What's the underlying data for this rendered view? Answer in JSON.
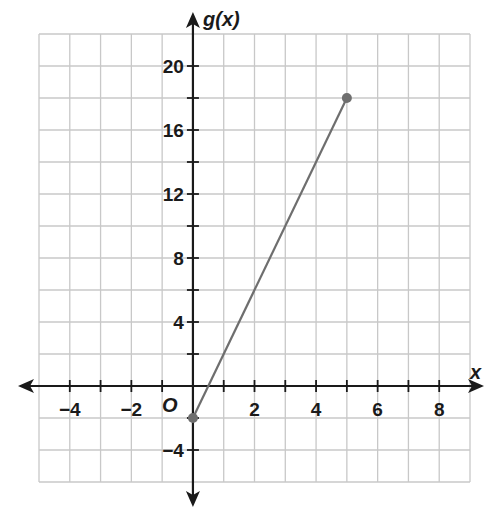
{
  "chart_data": {
    "type": "line",
    "title": "",
    "xlabel": "x",
    "ylabel": "g(x)",
    "origin_label": "O",
    "xlim": [
      -5,
      9
    ],
    "ylim": [
      -6,
      22
    ],
    "x_grid_step": 1,
    "y_grid_step": 2,
    "grid": true,
    "x_ticks": [
      -4,
      -2,
      2,
      4,
      6,
      8
    ],
    "x_tick_labels": [
      "−4",
      "−2",
      "2",
      "4",
      "6",
      "8"
    ],
    "y_ticks": [
      -4,
      4,
      8,
      12,
      16,
      20
    ],
    "y_tick_labels": [
      "−4",
      "4",
      "8",
      "12",
      "16",
      "20"
    ],
    "series": [
      {
        "name": "g(x)",
        "equation": "g(x) = 4x - 2",
        "x": [
          0,
          5
        ],
        "y": [
          -2,
          18
        ],
        "endpoints": "closed",
        "color": "#6e6e6e"
      }
    ],
    "colors": {
      "grid": "#c8c8c8",
      "axis": "#1a1a1a",
      "line": "#6e6e6e",
      "point": "#6e6e6e"
    }
  }
}
